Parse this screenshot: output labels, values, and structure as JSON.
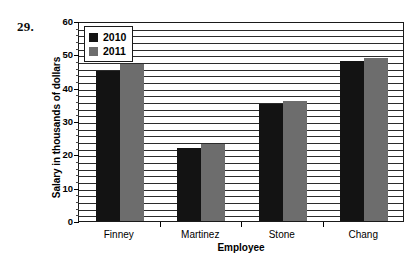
{
  "problem": {
    "number": "29."
  },
  "chart_data": {
    "type": "bar",
    "title": "",
    "xlabel": "Employee",
    "ylabel": "Salary in thousands of dollars",
    "categories": [
      "Finney",
      "Martinez",
      "Stone",
      "Chang"
    ],
    "series": [
      {
        "name": "2010",
        "color": "#131313",
        "values": [
          45,
          22,
          35,
          48
        ]
      },
      {
        "name": "2011",
        "color": "#6d6d6d",
        "values": [
          47,
          23,
          36,
          49
        ]
      }
    ],
    "ylim": [
      0,
      60
    ],
    "ytick_step": 10,
    "yticks": [
      0,
      10,
      20,
      30,
      40,
      50,
      60
    ],
    "ytick_labels": [
      "0",
      "10",
      "20",
      "30",
      "40",
      "50",
      "60"
    ],
    "minor_gridline_step": 2,
    "grid": true,
    "legend_position": "top-left",
    "legend_entries": [
      "2010",
      "2011"
    ]
  }
}
